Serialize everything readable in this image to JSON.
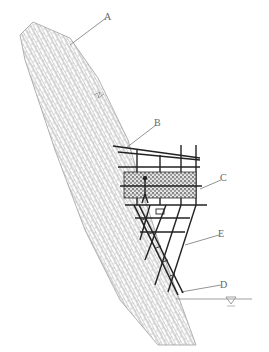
{
  "diagram": {
    "type": "engineering cross-section",
    "labels": [
      {
        "id": "A",
        "text": "A",
        "x": 106,
        "y": 14
      },
      {
        "id": "B",
        "text": "B",
        "x": 156,
        "y": 121
      },
      {
        "id": "C",
        "text": "C",
        "x": 221,
        "y": 176
      },
      {
        "id": "D",
        "text": "D",
        "x": 221,
        "y": 283
      },
      {
        "id": "E",
        "text": "E",
        "x": 219,
        "y": 232
      }
    ],
    "water_level_symbol": "▽",
    "colors": {
      "slope_hatch": "#9a9a9a",
      "scaffold": "#222222",
      "leader": "#777777",
      "mesh_fill": "#555555"
    }
  }
}
